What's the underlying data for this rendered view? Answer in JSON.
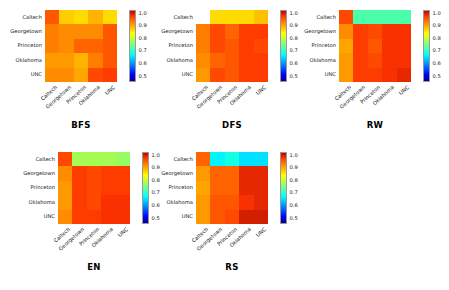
{
  "figure": {
    "row_labels": [
      "Caltech",
      "Georgetown",
      "Princeton",
      "Oklahoma",
      "UNC"
    ],
    "col_labels": [
      "Caltech",
      "Georgetown",
      "Princeton",
      "Oklahoma",
      "UNC"
    ],
    "colorbar_ticks": [
      "1.0",
      "0.9",
      "0.8",
      "0.7",
      "0.6",
      "0.5"
    ],
    "colorbar_min": 0.45,
    "colorbar_max": 1.02
  },
  "chart_data": [
    {
      "type": "heatmap",
      "title": "BFS",
      "xlabel": "",
      "ylabel": "",
      "x": [
        "Caltech",
        "Georgetown",
        "Princeton",
        "Oklahoma",
        "UNC"
      ],
      "y": [
        "Caltech",
        "Georgetown",
        "Princeton",
        "Oklahoma",
        "UNC"
      ],
      "zlim": [
        0.45,
        1.02
      ],
      "colormap": "jet",
      "legend": "colorbar-right",
      "grid": false,
      "values": [
        [
          0.93,
          0.84,
          0.83,
          0.86,
          0.83
        ],
        [
          0.9,
          0.89,
          0.89,
          0.89,
          0.93
        ],
        [
          0.9,
          0.89,
          0.92,
          0.92,
          0.93
        ],
        [
          0.88,
          0.88,
          0.86,
          0.9,
          0.93
        ],
        [
          0.89,
          0.89,
          0.87,
          0.94,
          0.95
        ]
      ]
    },
    {
      "type": "heatmap",
      "title": "DFS",
      "xlabel": "",
      "ylabel": "",
      "x": [
        "Caltech",
        "Georgetown",
        "Princeton",
        "Oklahoma",
        "UNC"
      ],
      "y": [
        "Caltech",
        "Georgetown",
        "Princeton",
        "Oklahoma",
        "UNC"
      ],
      "zlim": [
        0.45,
        1.02
      ],
      "colormap": "jet",
      "legend": "colorbar-right",
      "grid": false,
      "values": [
        [
          null,
          0.83,
          0.83,
          0.83,
          0.85
        ],
        [
          0.9,
          0.94,
          0.92,
          0.95,
          0.95
        ],
        [
          0.9,
          0.94,
          0.93,
          0.95,
          0.94
        ],
        [
          0.89,
          0.92,
          0.93,
          0.95,
          0.95
        ],
        [
          0.88,
          0.94,
          0.93,
          0.95,
          0.95
        ]
      ]
    },
    {
      "type": "heatmap",
      "title": "RW",
      "xlabel": "",
      "ylabel": "",
      "x": [
        "Caltech",
        "Georgetown",
        "Princeton",
        "Oklahoma",
        "UNC"
      ],
      "y": [
        "Caltech",
        "Georgetown",
        "Princeton",
        "Oklahoma",
        "UNC"
      ],
      "zlim": [
        0.45,
        1.02
      ],
      "colormap": "jet",
      "legend": "colorbar-right",
      "grid": false,
      "values": [
        [
          0.94,
          0.7,
          0.7,
          0.7,
          0.7
        ],
        [
          0.89,
          0.95,
          0.94,
          0.96,
          0.96
        ],
        [
          0.87,
          0.95,
          0.93,
          0.96,
          0.96
        ],
        [
          0.88,
          0.95,
          0.94,
          0.96,
          0.96
        ],
        [
          0.88,
          0.95,
          0.95,
          0.96,
          0.97
        ]
      ]
    },
    {
      "type": "heatmap",
      "title": "EN",
      "xlabel": "",
      "ylabel": "",
      "x": [
        "Caltech",
        "Georgetown",
        "Princeton",
        "Oklahoma",
        "UNC"
      ],
      "y": [
        "Caltech",
        "Georgetown",
        "Princeton",
        "Oklahoma",
        "UNC"
      ],
      "zlim": [
        0.45,
        1.02
      ],
      "colormap": "jet",
      "legend": "colorbar-right",
      "grid": false,
      "values": [
        [
          0.94,
          0.76,
          0.76,
          0.76,
          0.75
        ],
        [
          0.89,
          0.95,
          0.94,
          0.95,
          0.95
        ],
        [
          0.88,
          0.95,
          0.94,
          0.95,
          0.95
        ],
        [
          0.88,
          0.95,
          0.94,
          0.96,
          0.96
        ],
        [
          0.89,
          0.95,
          0.95,
          0.96,
          0.96
        ]
      ]
    },
    {
      "type": "heatmap",
      "title": "RS",
      "xlabel": "",
      "ylabel": "",
      "x": [
        "Caltech",
        "Georgetown",
        "Princeton",
        "Oklahoma",
        "UNC"
      ],
      "y": [
        "Caltech",
        "Georgetown",
        "Princeton",
        "Oklahoma",
        "UNC"
      ],
      "zlim": [
        0.45,
        1.02
      ],
      "colormap": "jet",
      "legend": "colorbar-right",
      "grid": false,
      "values": [
        [
          0.92,
          0.64,
          0.66,
          0.63,
          0.63
        ],
        [
          0.88,
          0.92,
          0.92,
          0.97,
          0.97
        ],
        [
          0.87,
          0.92,
          0.92,
          0.97,
          0.97
        ],
        [
          0.88,
          0.93,
          0.93,
          0.96,
          0.97
        ],
        [
          0.88,
          0.93,
          0.94,
          0.98,
          0.98
        ]
      ]
    }
  ],
  "layout": {
    "panels": [
      {
        "key": "bfs",
        "left": 45,
        "top": 10,
        "size": 72,
        "title_top": 120,
        "title_left": 40
      },
      {
        "key": "dfs",
        "left": 196,
        "top": 10,
        "size": 72,
        "title_top": 120,
        "title_left": 191
      },
      {
        "key": "rw",
        "left": 339,
        "top": 10,
        "size": 72,
        "title_top": 120,
        "title_left": 334
      },
      {
        "key": "en",
        "left": 58,
        "top": 152,
        "size": 72,
        "title_top": 262,
        "title_left": 53
      },
      {
        "key": "rs",
        "left": 196,
        "top": 152,
        "size": 72,
        "title_top": 262,
        "title_left": 191
      }
    ]
  }
}
